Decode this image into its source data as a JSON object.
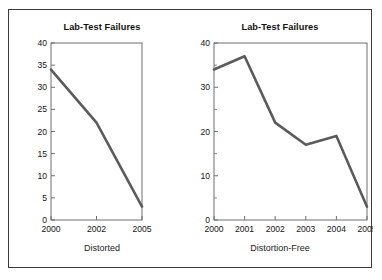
{
  "figure": {
    "border_color": "#3a3a3a",
    "background": "#ffffff",
    "line_color": "#5b5b5b",
    "axis_color": "#6f6f6f"
  },
  "panels": [
    {
      "key": "distorted",
      "title": "Lab-Test Failures",
      "caption": "Distorted",
      "y_ticks": [
        "0",
        "5",
        "10",
        "15",
        "20",
        "25",
        "30",
        "35",
        "40"
      ],
      "x_ticks": [
        "2000",
        "2002",
        "2005"
      ]
    },
    {
      "key": "distortion_free",
      "title": "Lab-Test Failures",
      "caption": "Distortion-Free",
      "y_ticks": [
        "0",
        "10",
        "20",
        "30",
        "40"
      ],
      "x_ticks": [
        "2000",
        "2001",
        "2002",
        "2003",
        "2004",
        "2005"
      ]
    }
  ],
  "chart_data": [
    {
      "type": "line",
      "title": "Lab-Test Failures",
      "xlabel": "Distorted",
      "ylabel": "",
      "categories": [
        "2000",
        "2002",
        "2005"
      ],
      "x": [
        2000,
        2002,
        2005
      ],
      "values": [
        34,
        22,
        3
      ],
      "ylim": [
        0,
        40
      ],
      "ytick_step": 5,
      "grid": false,
      "legend": "none",
      "note": "X axis plots only three of the six years at equal spacing, compressing 2000-2002 and 2002-2005 intervals equally, which distorts the trend into a near-straight decline."
    },
    {
      "type": "line",
      "title": "Lab-Test Failures",
      "xlabel": "Distortion-Free",
      "ylabel": "",
      "categories": [
        "2000",
        "2001",
        "2002",
        "2003",
        "2004",
        "2005"
      ],
      "x": [
        2000,
        2001,
        2002,
        2003,
        2004,
        2005
      ],
      "values": [
        34,
        37,
        22,
        17,
        19,
        3
      ],
      "ylim": [
        0,
        40
      ],
      "ytick_step": 10,
      "ytick_minor_step": 5,
      "grid": false,
      "legend": "none",
      "note": "All six years shown at uniform spacing, revealing the 2001 peak and the 2004 uptick hidden in the distorted version."
    }
  ]
}
